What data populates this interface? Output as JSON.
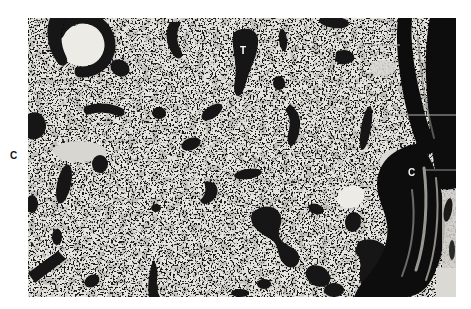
{
  "figure": {
    "kind": "black-and-white photomicrograph",
    "appearance": "pale finely speckled tissue field crossed by scattered dark-stained elongated blobs and bands; a dense dark double band runs along the right edge; letters T and C are overlaid on the image and a C sits in the left white margin",
    "page_background": "#ffffff",
    "tissue_tone": "#e6e4df",
    "stain_color": "#121212",
    "lumen_color": "#edebe6",
    "labels": {
      "t": {
        "text": "T",
        "color": "#ffffff"
      },
      "c_left": {
        "text": "C",
        "color": "#161616"
      },
      "c_right": {
        "text": "C",
        "color": "#f2f2ef"
      }
    }
  }
}
